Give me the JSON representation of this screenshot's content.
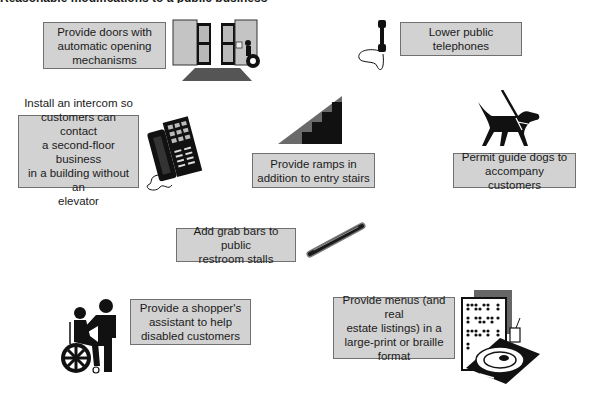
{
  "title": "Reasonable modifications to a public business",
  "colors": {
    "box_fill": "#d2d2d2",
    "box_border": "#707070",
    "icon_dark": "#111111",
    "icon_grey": "#b8b8b8"
  },
  "items": [
    {
      "id": "doors",
      "label": "Provide doors with\nautomatic opening\nmechanisms",
      "icon": "automatic-doors-icon"
    },
    {
      "id": "telephones",
      "label": "Lower public\ntelephones",
      "icon": "telephone-handset-icon"
    },
    {
      "id": "intercom",
      "label": "Install an intercom so\ncustomers can contact\na second-floor business\nin a building without an\nelevator",
      "icon": "intercom-phone-icon"
    },
    {
      "id": "ramps",
      "label": "Provide ramps in\naddition to entry stairs",
      "icon": "ramp-stairs-icon"
    },
    {
      "id": "guide_dogs",
      "label": "Permit guide dogs to\naccompany customers",
      "icon": "guide-dog-icon"
    },
    {
      "id": "grab_bars",
      "label": "Add grab bars to public\nrestroom stalls",
      "icon": "grab-bar-icon"
    },
    {
      "id": "shopper_assistant",
      "label": "Provide a shopper's\nassistant to help\ndisabled customers",
      "icon": "wheelchair-assistant-icon"
    },
    {
      "id": "menus",
      "label": "Provide menus (and real\nestate listings) in a\nlarge-print or braille\nformat",
      "icon": "braille-menu-icon"
    }
  ]
}
